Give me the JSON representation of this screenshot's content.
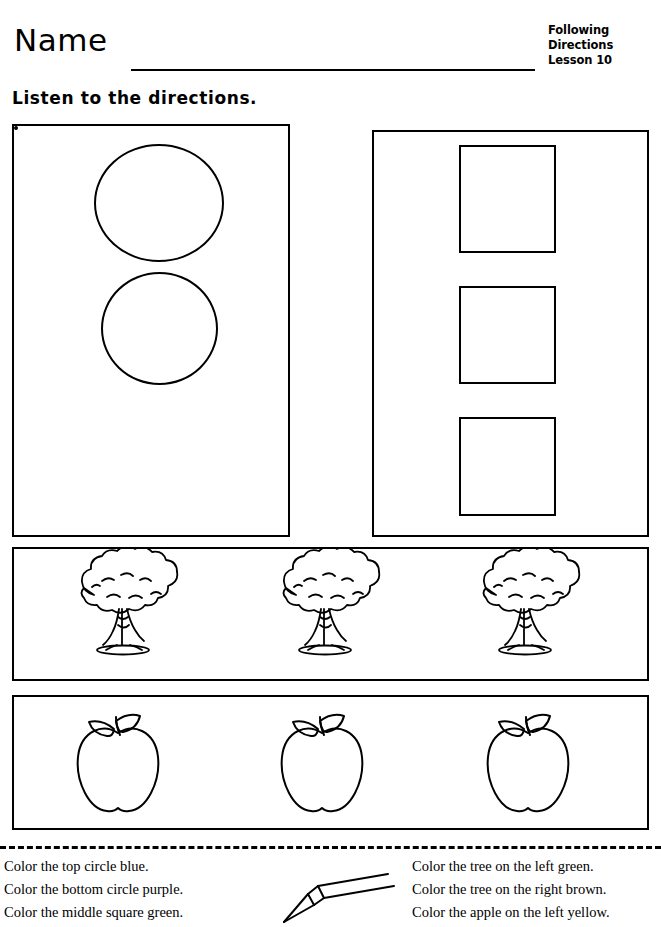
{
  "header": {
    "name_label": "Name",
    "title_line1": "Following",
    "title_line2": "Directions",
    "title_line3": "Lesson 10"
  },
  "subtitle": "Listen to the directions.",
  "shapes": {
    "circles_count": 3,
    "squares_count": 3,
    "trees_count": 3,
    "apples_count": 3
  },
  "instructions": {
    "left": [
      "Color the top circle blue.",
      "Color the bottom circle purple.",
      "Color the middle square green."
    ],
    "right": [
      "Color the tree on the left green.",
      "Color the tree on the right brown.",
      "Color the apple on the left yellow."
    ]
  },
  "colors": {
    "ink": "#000000",
    "paper": "#ffffff"
  }
}
